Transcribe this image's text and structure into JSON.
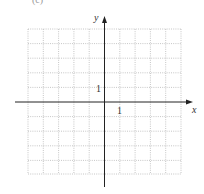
{
  "figure": {
    "partial_caption": "(c)",
    "grid": {
      "cols": 10,
      "rows": 10,
      "color": "#b8b8b8",
      "style": "dotted"
    },
    "axes": {
      "x_label": "x",
      "y_label": "y",
      "x_tick_label": "1",
      "y_tick_label": "1",
      "color": "#222222"
    }
  }
}
